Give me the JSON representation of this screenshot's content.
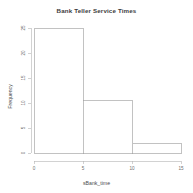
{
  "chart_data": {
    "type": "bar",
    "title": "Bank Teller Service Times",
    "xlabel": "sBank_time",
    "ylabel": "Frequency",
    "bin_edges": [
      0,
      5,
      10,
      15
    ],
    "categories": [
      "0-5",
      "5-10",
      "10-15"
    ],
    "values": [
      25,
      10.5,
      2
    ],
    "xlim": [
      0,
      15
    ],
    "ylim": [
      0,
      26
    ],
    "xticks": [
      0,
      5,
      10,
      15
    ],
    "xtick_labels": [
      "0",
      "5",
      "10",
      "15"
    ],
    "yticks": [
      0,
      5,
      10,
      15,
      20,
      25
    ],
    "ytick_labels": [
      "0",
      "5",
      "10",
      "15",
      "20",
      "25"
    ],
    "grid": false,
    "legend": false,
    "bar_fill": "#ffffff",
    "bar_border": "#9a9a9a",
    "axis_color": "#b4b4b4"
  }
}
